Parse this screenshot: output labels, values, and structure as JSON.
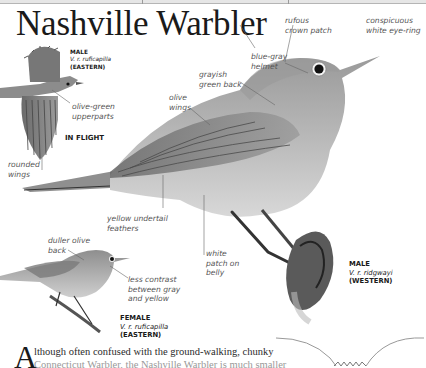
{
  "title": "Nashville Warbler",
  "figures": {
    "in_flight": {
      "sex": "MALE",
      "subspecies": "V. r. ruficapilla",
      "region": "(EASTERN)",
      "caption": "IN FLIGHT"
    },
    "main": {
      "sex": "MALE",
      "subspecies": "V. r. ridgwayi",
      "region": "(WESTERN)"
    },
    "female": {
      "sex": "FEMALE",
      "subspecies": "V. r. ruficapilla",
      "region": "(EASTERN)"
    }
  },
  "labels": {
    "olive_green_upperparts": [
      "olive-green",
      "upperparts"
    ],
    "rounded_wings": [
      "rounded",
      "wings"
    ],
    "olive_wings": [
      "olive",
      "wings"
    ],
    "grayish_green_back": [
      "grayish",
      "green back"
    ],
    "blue_gray_helmet": [
      "blue-gray",
      "helmet"
    ],
    "rufous_crown_patch": [
      "rufous",
      "crown patch"
    ],
    "white_eye_ring": [
      "conspicuous",
      "white eye-ring"
    ],
    "yellow_undertail": [
      "yellow undertail",
      "feathers"
    ],
    "white_belly_patch": [
      "white",
      "patch on",
      "belly"
    ],
    "duller_olive_back": [
      "duller olive",
      "back"
    ],
    "less_contrast": [
      "less contrast",
      "between gray",
      "and yellow"
    ]
  },
  "body_text": {
    "dropcap": "A",
    "line1": "lthough often confused with the ground-walking, chunky",
    "line2": "Connecticut Warbler, the Nashville Warbler is much smaller"
  },
  "colors": {
    "text": "#1a1a1a",
    "label": "#555555",
    "bird_gray": "#a8a8a8",
    "rule": "#9a9a9a"
  }
}
